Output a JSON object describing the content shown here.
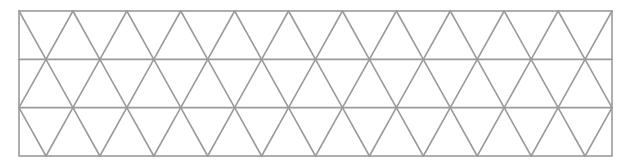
{
  "diagram": {
    "type": "isometric-triangle-grid",
    "rect": {
      "x": 19,
      "y": 11,
      "width": 593,
      "height": 145
    },
    "rows": 3,
    "triangles_per_row_base": 11,
    "stroke_color": "#9a9a9a",
    "stroke_width": 1.6,
    "background": "#ffffff"
  }
}
